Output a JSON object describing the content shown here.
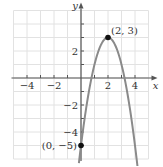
{
  "chart_data": {
    "type": "line",
    "title": "",
    "function": "y = -2(x - 2)^2 + 3",
    "xlabel": "x",
    "ylabel": "y",
    "xlim": [
      -5,
      5
    ],
    "ylim": [
      -6,
      5
    ],
    "grid": true,
    "x_ticks": [
      -4,
      -2,
      2,
      4
    ],
    "y_ticks": [
      2,
      -2,
      -4
    ],
    "x_tick_labels": [
      "−4",
      "−2",
      "2",
      "4"
    ],
    "y_tick_labels": [
      "2",
      "−2",
      "−4"
    ],
    "points": [
      {
        "x": 2,
        "y": 3,
        "label": "(2, 3)"
      },
      {
        "x": 0,
        "y": -5,
        "label": "(0, −5)"
      }
    ],
    "curve": {
      "x_start": 0,
      "x_end": 4.2,
      "color": "#888888",
      "arrow_at_end": true,
      "arrow_at_start": true
    },
    "colors": {
      "grid": "#e2e2e2",
      "axis": "#555555",
      "curve": "#8a8a8a",
      "point": "#111111"
    }
  }
}
